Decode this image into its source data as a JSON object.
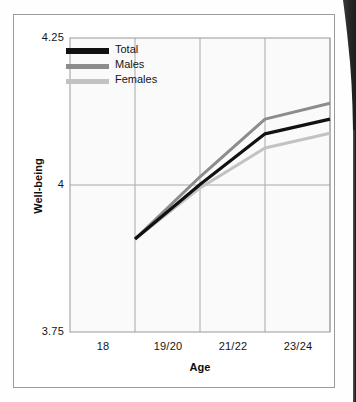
{
  "figure": {
    "type": "line-chart-figure",
    "background_color": "#ffffff",
    "frame_color": "#9a9a9a",
    "gutter_shadow_color": "#2b2b2b"
  },
  "chart_data": {
    "type": "line",
    "title": "",
    "xlabel": "Age",
    "ylabel": "Well-being",
    "categories": [
      "18",
      "19/20",
      "21/22",
      "23/24"
    ],
    "ylim": [
      3.75,
      4.25
    ],
    "yticks": [
      "3.75",
      "4",
      "4.25"
    ],
    "ytick_values": [
      3.75,
      4.0,
      4.25
    ],
    "grid": "both",
    "legend_position": "top-left",
    "series": [
      {
        "name": "Total",
        "color": "#111111",
        "values": [
          3.908,
          4.001,
          4.087,
          4.112
        ]
      },
      {
        "name": "Males",
        "color": "#8c8c8c",
        "values": [
          3.908,
          4.014,
          4.112,
          4.139
        ]
      },
      {
        "name": "Females",
        "color": "#c2c2c2",
        "values": [
          3.908,
          3.995,
          4.063,
          4.088
        ]
      }
    ]
  },
  "axes": {
    "y_top_label": "4.25",
    "y_mid_label": "4",
    "y_bottom_label": "3.75",
    "x_labels": [
      "18",
      "19/20",
      "21/22",
      "23/24"
    ],
    "x_axis_title": "Age",
    "y_axis_title": "Well-being"
  },
  "legend": {
    "items": [
      {
        "label": "Total",
        "color": "#111111"
      },
      {
        "label": "Males",
        "color": "#8c8c8c"
      },
      {
        "label": "Females",
        "color": "#c2c2c2"
      }
    ]
  }
}
